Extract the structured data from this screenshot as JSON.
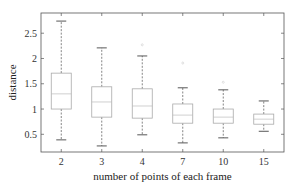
{
  "chart_data": {
    "type": "boxplot",
    "title": "",
    "xlabel": "number of points of each frame",
    "ylabel": "distance",
    "categories": [
      "2",
      "3",
      "4",
      "7",
      "10",
      "15"
    ],
    "ylim": [
      0.15,
      2.9
    ],
    "yticks": [
      0.5,
      1,
      1.5,
      2,
      2.5
    ],
    "ytick_labels": [
      "0.5",
      "1",
      "1.5",
      "2",
      "2.5"
    ],
    "grid": false,
    "legend": null,
    "boxes": [
      {
        "category": "2",
        "whisker_low": 0.39,
        "q1": 1.0,
        "median": 1.3,
        "q3": 1.71,
        "whisker_high": 2.74,
        "outliers": []
      },
      {
        "category": "3",
        "whisker_low": 0.27,
        "q1": 0.84,
        "median": 1.14,
        "q3": 1.44,
        "whisker_high": 2.21,
        "outliers": []
      },
      {
        "category": "4",
        "whisker_low": 0.49,
        "q1": 0.82,
        "median": 1.06,
        "q3": 1.4,
        "whisker_high": 2.05,
        "outliers": [
          2.27
        ]
      },
      {
        "category": "7",
        "whisker_low": 0.33,
        "q1": 0.72,
        "median": 0.88,
        "q3": 1.1,
        "whisker_high": 1.42,
        "outliers": [
          1.91
        ]
      },
      {
        "category": "10",
        "whisker_low": 0.43,
        "q1": 0.72,
        "median": 0.84,
        "q3": 1.0,
        "whisker_high": 1.38,
        "outliers": [
          1.53
        ]
      },
      {
        "category": "15",
        "whisker_low": 0.56,
        "q1": 0.7,
        "median": 0.8,
        "q3": 0.9,
        "whisker_high": 1.16,
        "outliers": []
      }
    ],
    "colors": {
      "axis": "#555555",
      "box": "#aaaaaa",
      "whisker": "#666666",
      "cap": "#444444",
      "median": "#bbbbbb",
      "outlier": "#cccccc"
    }
  }
}
